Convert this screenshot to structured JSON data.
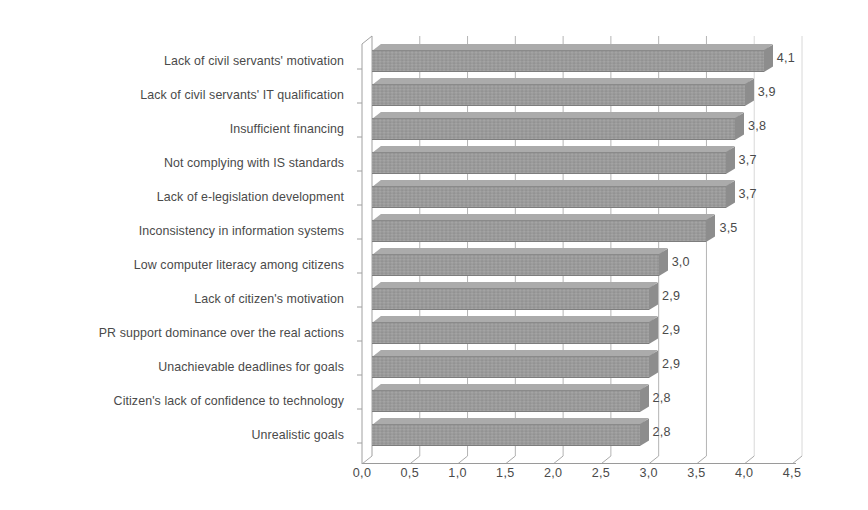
{
  "chart_data": {
    "type": "bar",
    "orientation": "horizontal",
    "title": "",
    "xlabel": "",
    "ylabel": "",
    "xlim": [
      0.0,
      4.5
    ],
    "xticks": [
      "0,0",
      "0,5",
      "1,0",
      "1,5",
      "2,0",
      "2,5",
      "3,0",
      "3,5",
      "4,0",
      "4,5"
    ],
    "xtick_values": [
      0.0,
      0.5,
      1.0,
      1.5,
      2.0,
      2.5,
      3.0,
      3.5,
      4.0,
      4.5
    ],
    "grid": "vertical",
    "legend": "none",
    "decimal_separator": ",",
    "bar_color": "#9b9b9b",
    "background_color": "#ffffff",
    "text_color": "#4a4a4a",
    "categories": [
      "Lack of civil servants' motivation",
      "Lack of civil servants' IT qualification",
      "Insufficient financing",
      "Not complying with IS standards",
      "Lack of e-legislation development",
      "Inconsistency in information systems",
      "Low computer literacy among citizens",
      "Lack of citizen's motivation",
      "PR support dominance over the real actions",
      "Unachievable deadlines for goals",
      "Citizen's lack of confidence to technology",
      "Unrealistic goals"
    ],
    "values": [
      4.1,
      3.9,
      3.8,
      3.7,
      3.7,
      3.5,
      3.0,
      2.9,
      2.9,
      2.9,
      2.8,
      2.8
    ],
    "data_labels": [
      "4,1",
      "3,9",
      "3,8",
      "3,7",
      "3,7",
      "3,5",
      "3,0",
      "2,9",
      "2,9",
      "2,9",
      "2,8",
      "2,8"
    ]
  }
}
